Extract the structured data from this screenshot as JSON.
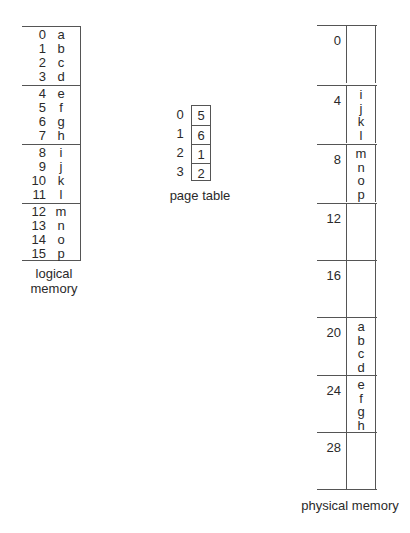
{
  "logical_memory": {
    "label_line1": "logical",
    "label_line2": "memory",
    "entries": [
      {
        "addr": "0",
        "val": "a"
      },
      {
        "addr": "1",
        "val": "b"
      },
      {
        "addr": "2",
        "val": "c"
      },
      {
        "addr": "3",
        "val": "d"
      },
      {
        "addr": "4",
        "val": "e"
      },
      {
        "addr": "5",
        "val": "f"
      },
      {
        "addr": "6",
        "val": "g"
      },
      {
        "addr": "7",
        "val": "h"
      },
      {
        "addr": "8",
        "val": "i"
      },
      {
        "addr": "9",
        "val": "j"
      },
      {
        "addr": "10",
        "val": "k"
      },
      {
        "addr": "11",
        "val": "l"
      },
      {
        "addr": "12",
        "val": "m"
      },
      {
        "addr": "13",
        "val": "n"
      },
      {
        "addr": "14",
        "val": "o"
      },
      {
        "addr": "15",
        "val": "p"
      }
    ]
  },
  "page_table": {
    "label": "page table",
    "entries": [
      {
        "page": "0",
        "frame": "5"
      },
      {
        "page": "1",
        "frame": "6"
      },
      {
        "page": "2",
        "frame": "1"
      },
      {
        "page": "3",
        "frame": "2"
      }
    ]
  },
  "physical_memory": {
    "label": "physical memory",
    "frames": [
      {
        "addr": "0",
        "contents": []
      },
      {
        "addr": "4",
        "contents": [
          "i",
          "j",
          "k",
          "l"
        ]
      },
      {
        "addr": "8",
        "contents": [
          "m",
          "n",
          "o",
          "p"
        ]
      },
      {
        "addr": "12",
        "contents": []
      },
      {
        "addr": "16",
        "contents": []
      },
      {
        "addr": "20",
        "contents": [
          "a",
          "b",
          "c",
          "d"
        ]
      },
      {
        "addr": "24",
        "contents": [
          "e",
          "f",
          "g",
          "h"
        ]
      },
      {
        "addr": "28",
        "contents": []
      }
    ]
  }
}
